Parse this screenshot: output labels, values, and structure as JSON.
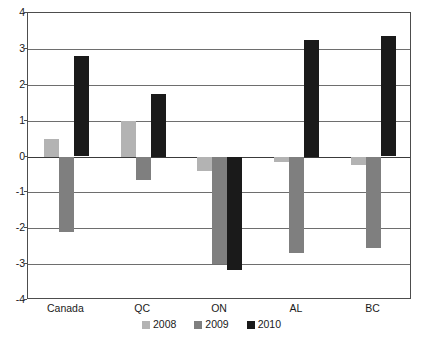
{
  "chart_data": {
    "type": "bar",
    "title": "",
    "subtitle": "",
    "xlabel": "",
    "ylabel": "",
    "categories": [
      "Canada",
      "QC",
      "ON",
      "AL",
      "BC"
    ],
    "series": [
      {
        "name": "2008",
        "color": "#b3b3b3",
        "values": [
          0.5,
          1.0,
          -0.4,
          -0.15,
          -0.25
        ]
      },
      {
        "name": "2009",
        "color": "#7f7f7f",
        "values": [
          -2.1,
          -0.65,
          -3.0,
          -2.7,
          -2.55
        ]
      },
      {
        "name": "2010",
        "color": "#1a1a1a",
        "values": [
          2.8,
          1.75,
          -3.15,
          3.25,
          3.35
        ]
      }
    ],
    "ylim": [
      -4,
      4
    ],
    "yticks": [
      4,
      3,
      2,
      1,
      0,
      -1,
      -2,
      -3,
      -4
    ],
    "ytick_labels": [
      "4",
      "3",
      "2",
      "1",
      "0",
      "-1",
      "-2",
      "-3",
      "-4"
    ],
    "grid": true,
    "legend_position": "bottom",
    "zero_line": 0
  },
  "legend": {
    "items": [
      {
        "label": "2008",
        "color": "#b3b3b3"
      },
      {
        "label": "2009",
        "color": "#7f7f7f"
      },
      {
        "label": "2010",
        "color": "#1a1a1a"
      }
    ]
  }
}
